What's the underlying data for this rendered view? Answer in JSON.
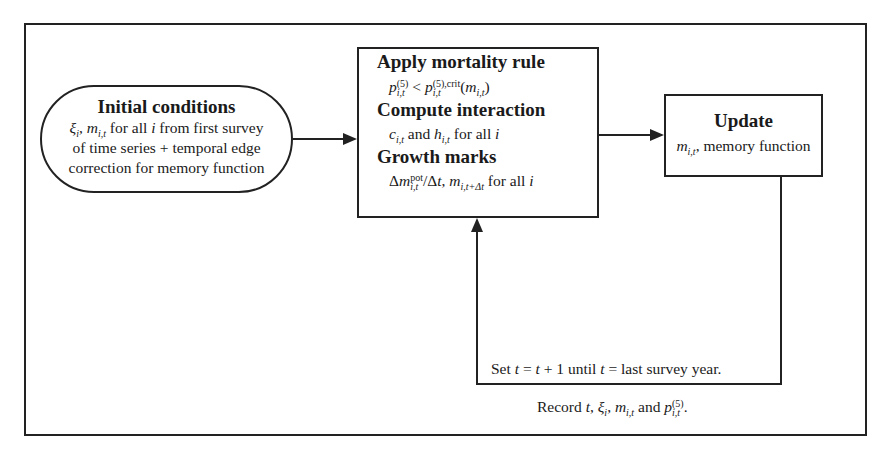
{
  "diagram": {
    "type": "flowchart",
    "nodes": {
      "initial": {
        "title": "Initial conditions",
        "line1_vars": "ξ",
        "line1_text": " for all ",
        "line1_i": "i",
        "line1_rest": " from first survey",
        "line2": "of time series + temporal edge",
        "line3": "correction for memory function"
      },
      "center": {
        "title1": "Apply mortality rule",
        "rule": "p(5)i,t < p(5),criti,t(mi,t)",
        "title2": "Compute interaction",
        "interaction_and": " and ",
        "interaction_rest": " for all ",
        "interaction_i": "i",
        "title3": "Growth marks",
        "growth_rest": " for all ",
        "growth_i": "i"
      },
      "update": {
        "title": "Update",
        "body_text": ", memory function"
      }
    },
    "loop_label": {
      "set": "Set ",
      "t": "t",
      "eq1": " = ",
      "plus": " + 1 until ",
      "eq2": " = last survey year."
    },
    "record_label": {
      "record": "Record ",
      "and": " and ",
      "end": "."
    },
    "edges": [
      {
        "from": "initial",
        "to": "center"
      },
      {
        "from": "center",
        "to": "update"
      },
      {
        "from": "update",
        "to": "center",
        "label": "Set t = t + 1 until t = last survey year."
      }
    ]
  }
}
